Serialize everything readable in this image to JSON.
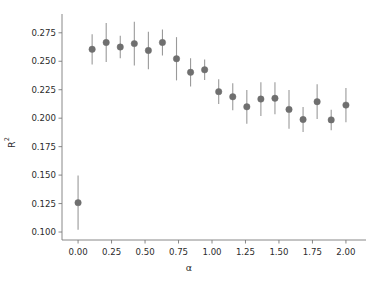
{
  "chart_data": {
    "type": "scatter",
    "title": "",
    "xlabel": "α",
    "ylabel": "R²",
    "xlim": [
      -0.12,
      2.12
    ],
    "ylim": [
      0.093,
      0.288
    ],
    "grid": false,
    "legend": null,
    "marker": {
      "shape": "circle",
      "color": "#6f6f6f",
      "size": 5.2
    },
    "errorbar": {
      "style": "vertical-line",
      "caps": false,
      "color": "#9a9a9a",
      "width": 1.1
    },
    "xticks": [
      "0.00",
      "0.25",
      "0.50",
      "0.75",
      "1.00",
      "1.25",
      "1.50",
      "1.75",
      "2.00"
    ],
    "xtick_values": [
      0.0,
      0.25,
      0.5,
      0.75,
      1.0,
      1.25,
      1.5,
      1.75,
      2.0
    ],
    "yticks": [
      "0.100",
      "0.125",
      "0.150",
      "0.175",
      "0.200",
      "0.225",
      "0.250",
      "0.275"
    ],
    "ytick_values": [
      0.1,
      0.125,
      0.15,
      0.175,
      0.2,
      0.225,
      0.25,
      0.275
    ],
    "x": [
      0.0,
      0.105,
      0.21,
      0.315,
      0.42,
      0.525,
      0.63,
      0.735,
      0.84,
      0.945,
      1.05,
      1.155,
      1.26,
      1.365,
      1.47,
      1.575,
      1.68,
      1.785,
      1.89,
      2.0
    ],
    "values": [
      0.1258,
      0.2605,
      0.2665,
      0.2625,
      0.2655,
      0.2595,
      0.2665,
      0.2522,
      0.2403,
      0.2425,
      0.2233,
      0.2188,
      0.21,
      0.2168,
      0.2175,
      0.2077,
      0.1988,
      0.2145,
      0.1985,
      0.2115
    ],
    "yerr": [
      0.0238,
      0.0133,
      0.0172,
      0.0098,
      0.0192,
      0.0165,
      0.0115,
      0.019,
      0.0124,
      0.009,
      0.0108,
      0.0118,
      0.0148,
      0.0148,
      0.014,
      0.017,
      0.011,
      0.0153,
      0.009,
      0.015
    ]
  }
}
